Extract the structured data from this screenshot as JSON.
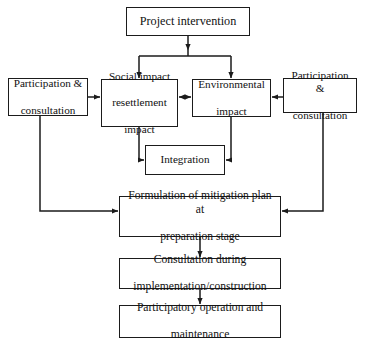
{
  "diagram": {
    "background_color": "#ffffff",
    "line_color": "#1b1b1b",
    "nodes": {
      "project_intervention": "Project intervention",
      "participation_left": "Participation &\nconsultation",
      "participation_left_line1": "Participation &",
      "participation_left_line2": "consultation",
      "social_impact_line1": "Social impact",
      "social_impact_line2": "resettlement",
      "social_impact_line3": "impact",
      "environmental_line1": "Environmental",
      "environmental_line2": "impact",
      "participation_right_line1": "Participation &",
      "participation_right_line2": "consultation",
      "integration": "Integration",
      "formulation_line1": "Formulation of mitigation plan at",
      "formulation_line2": "preparation stage",
      "consultation_line1": "Consultation during",
      "consultation_line2": "implementation/construction",
      "participatory_line1": "Participatory operation and",
      "participatory_line2": "maintenance"
    },
    "connectors": [
      {
        "name": "project-to-split",
        "from": "project_intervention",
        "to": "split-node",
        "type": "arrow-down"
      },
      {
        "name": "split-to-social",
        "from": "split-node",
        "to": "social_impact",
        "type": "arrow-down"
      },
      {
        "name": "split-to-environmental",
        "from": "split-node",
        "to": "environmental_impact",
        "type": "arrow-down"
      },
      {
        "name": "participation-left-to-social",
        "from": "participation_left",
        "to": "social_impact",
        "type": "arrow-right"
      },
      {
        "name": "social-to-environmental",
        "from": "social_impact",
        "to": "environmental_impact",
        "type": "arrow-bidirectional"
      },
      {
        "name": "participation-right-to-environmental",
        "from": "participation_right",
        "to": "environmental_impact",
        "type": "arrow-left"
      },
      {
        "name": "social-to-integration",
        "from": "social_impact",
        "to": "integration",
        "type": "elbow-arrow-right"
      },
      {
        "name": "environmental-to-integration",
        "from": "environmental_impact",
        "to": "integration",
        "type": "elbow-arrow-left"
      },
      {
        "name": "participation-left-to-formulation",
        "from": "participation_left",
        "to": "formulation",
        "type": "elbow-arrow-right"
      },
      {
        "name": "participation-right-to-formulation",
        "from": "participation_right",
        "to": "formulation",
        "type": "elbow-arrow-left"
      },
      {
        "name": "formulation-to-consultation",
        "from": "formulation",
        "to": "consultation",
        "type": "arrow-down"
      },
      {
        "name": "consultation-to-participatory",
        "from": "consultation",
        "to": "participatory",
        "type": "arrow-down"
      }
    ]
  }
}
